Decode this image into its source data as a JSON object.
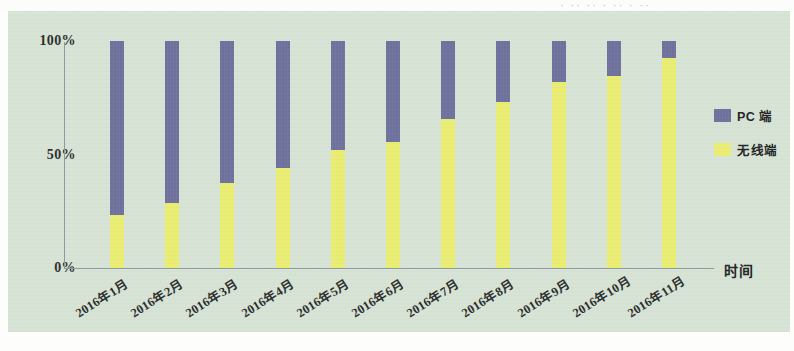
{
  "header": {
    "cropped_text": "· ·· ·· · ·· · ··"
  },
  "legend": {
    "items": [
      {
        "label": "PC 端",
        "color": "#6e729d",
        "swatch_name": "legend-swatch-pc"
      },
      {
        "label": "无线端",
        "color": "#e9ed72",
        "swatch_name": "legend-swatch-wireless"
      }
    ]
  },
  "axis": {
    "x_title": "时间",
    "y_ticks": [
      "100%",
      "50%",
      "0%"
    ]
  },
  "colors": {
    "background": "#d6e3d5",
    "pc": "#6e729d",
    "wireless": "#e9ed72",
    "axis_line": "#8d9aa0",
    "text": "#2b2d2c"
  },
  "chart_data": {
    "type": "bar",
    "subtype": "stacked-100-percent",
    "title": "",
    "xlabel": "时间",
    "ylabel": "",
    "ylim": [
      0,
      100
    ],
    "ytick_labels": [
      "0%",
      "50%",
      "100%"
    ],
    "grid": false,
    "legend_position": "right",
    "categories": [
      "2016年1月",
      "2016年2月",
      "2016年3月",
      "2016年4月",
      "2016年5月",
      "2016年6月",
      "2016年7月",
      "2016年8月",
      "2016年9月",
      "2016年10月",
      "2016年11月"
    ],
    "series": [
      {
        "name": "无线端",
        "color": "#e9ed72",
        "values": [
          23.5,
          28.8,
          37.6,
          44.2,
          51.8,
          55.3,
          65.5,
          73.0,
          81.9,
          84.5,
          92.5
        ]
      },
      {
        "name": "PC 端",
        "color": "#6e729d",
        "values": [
          76.5,
          71.2,
          62.4,
          55.8,
          48.2,
          44.7,
          34.5,
          27.0,
          18.1,
          15.5,
          7.5
        ]
      }
    ]
  }
}
